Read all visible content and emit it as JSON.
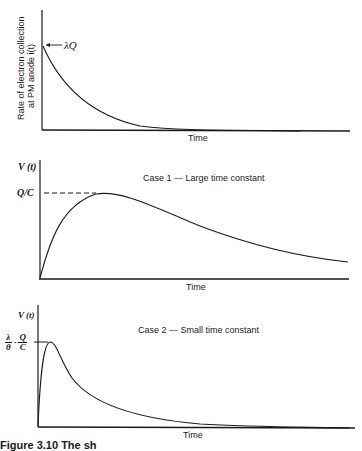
{
  "panels": [
    {
      "id": "current",
      "ylabel_line1": "Rate of electron collection",
      "ylabel_line2": "at PM anode i(t)",
      "xlabel": "Time",
      "marker_label": "λQ",
      "title": ""
    },
    {
      "id": "case1",
      "ylabel": "V (t)",
      "xlabel": "Time",
      "marker_label": "Q/C",
      "title": "Case 1 — Large time constant"
    },
    {
      "id": "case2",
      "ylabel": "V (t)",
      "xlabel": "Time",
      "marker_label_frac1_num": "λ",
      "marker_label_frac1_den": "θ",
      "marker_label_dot": "·",
      "marker_label_frac2_num": "Q",
      "marker_label_frac2_den": "C",
      "title": "Case 2 — Small time constant"
    }
  ],
  "caption": "Figure 3.10  The sh"
}
